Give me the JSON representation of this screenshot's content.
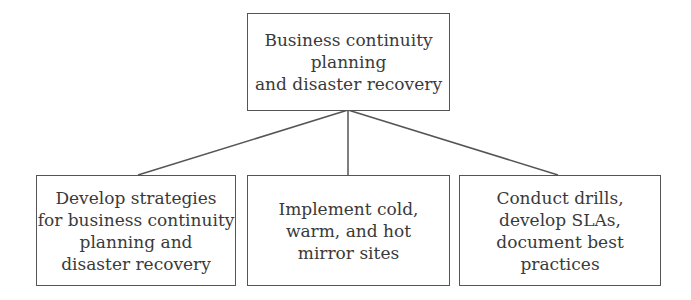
{
  "diagram": {
    "type": "hierarchy",
    "root": {
      "lines": [
        "Business continuity",
        "planning",
        "and disaster recovery"
      ]
    },
    "children": [
      {
        "lines": [
          "Develop strategies",
          "for business continuity",
          "planning and",
          "disaster recovery"
        ]
      },
      {
        "lines": [
          "Implement cold,",
          "warm, and hot",
          "mirror sites"
        ]
      },
      {
        "lines": [
          "Conduct drills,",
          "develop SLAs,",
          "document best",
          "practices"
        ]
      }
    ],
    "colors": {
      "border": "#555555",
      "text": "#3a3a3a",
      "background": "#ffffff"
    }
  }
}
